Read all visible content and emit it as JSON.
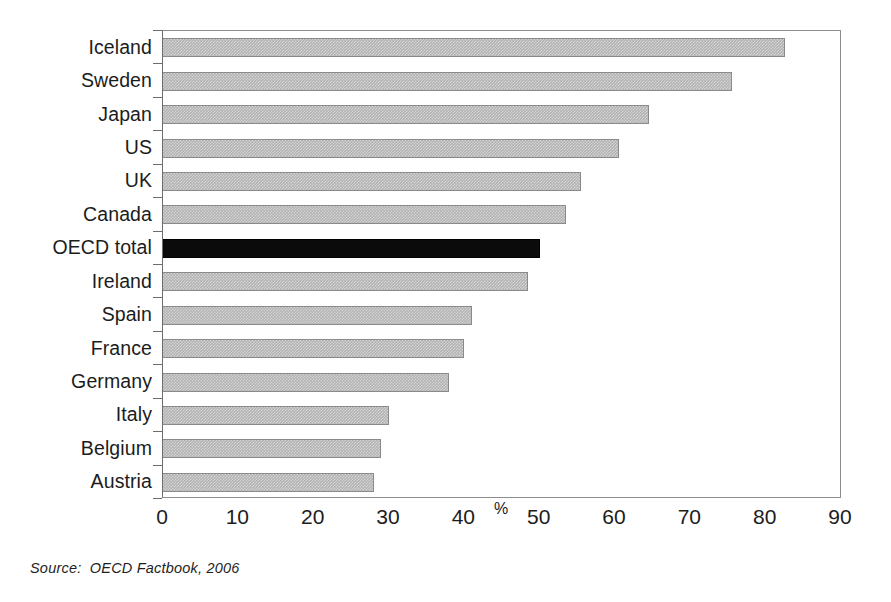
{
  "chart_data": {
    "type": "bar",
    "orientation": "horizontal",
    "title": "",
    "subtitle": "",
    "xlabel": "%",
    "ylabel": "",
    "xlim": [
      0,
      90
    ],
    "xticks": [
      0,
      10,
      20,
      30,
      40,
      50,
      60,
      70,
      80,
      90
    ],
    "xticklabels": [
      "0",
      "10",
      "20",
      "30",
      "40",
      "50",
      "60",
      "70",
      "80",
      "90"
    ],
    "grid": false,
    "legend": null,
    "categories": [
      "Iceland",
      "Sweden",
      "Japan",
      "US",
      "UK",
      "Canada",
      "OECD total",
      "Ireland",
      "Spain",
      "France",
      "Germany",
      "Italy",
      "Belgium",
      "Austria"
    ],
    "values": [
      82.5,
      75.5,
      64.5,
      60.5,
      55.5,
      53.5,
      50.0,
      48.5,
      41.0,
      40.0,
      38.0,
      30.0,
      29.0,
      28.0
    ],
    "highlight_category": "OECD total",
    "bar_colors": [
      "#b3b3b3",
      "#b3b3b3",
      "#b3b3b3",
      "#b3b3b3",
      "#b3b3b3",
      "#b3b3b3",
      "#000000",
      "#b3b3b3",
      "#b3b3b3",
      "#b3b3b3",
      "#b3b3b3",
      "#b3b3b3",
      "#b3b3b3",
      "#b3b3b3"
    ],
    "annotations": []
  },
  "axis": {
    "percent_symbol": "%",
    "percent_symbol_position": 45
  },
  "colors": {
    "bar_gray": "#b3b3b3",
    "bar_highlight": "#000000",
    "frame": "#8d8d8d",
    "text": "#1c1c1c",
    "background": "#ffffff"
  },
  "footer": {
    "source": "Source:  OECD Factbook, 2006"
  }
}
